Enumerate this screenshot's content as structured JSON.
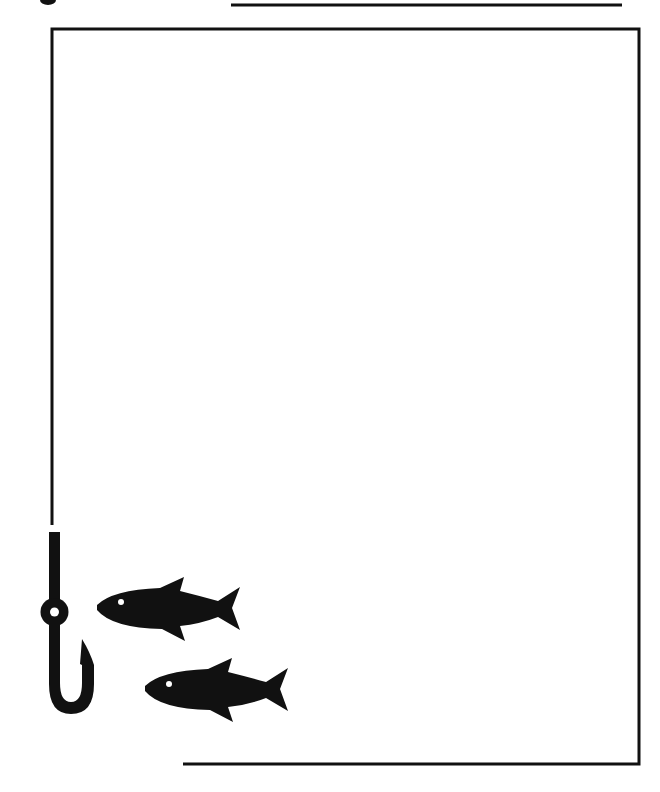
{
  "page": {
    "title": "",
    "background": "#ffffff",
    "ink_color": "#111111"
  },
  "frame": {
    "description": "Decorative fishing-themed page border",
    "stroke": "#111111"
  },
  "icons": [
    {
      "name": "fishing-hook-icon"
    },
    {
      "name": "fish-icon",
      "index": 1
    },
    {
      "name": "fish-icon",
      "index": 2
    }
  ]
}
